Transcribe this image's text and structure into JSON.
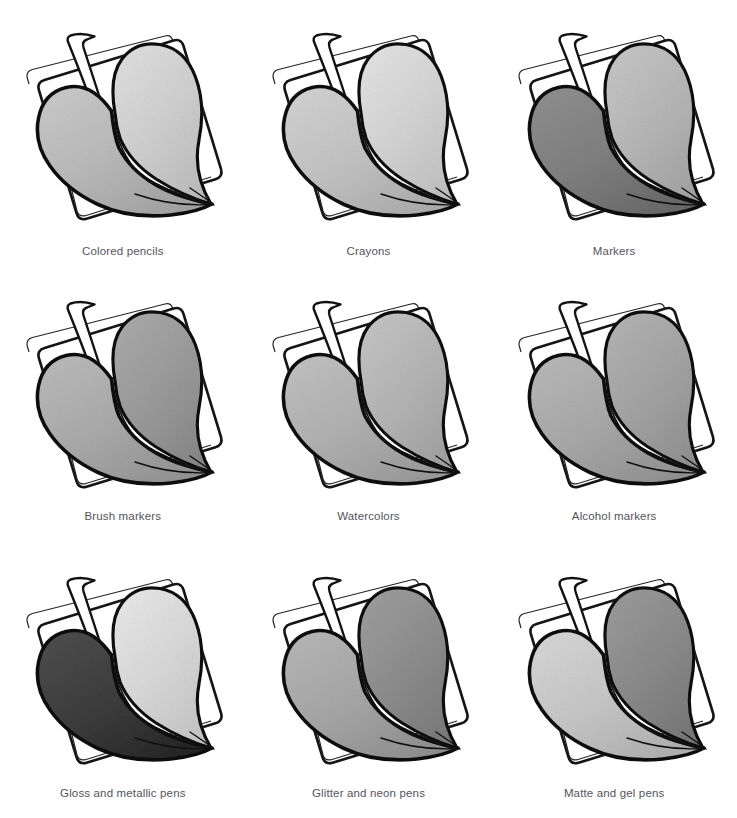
{
  "page": {
    "background_color": "#ffffff",
    "caption_color": "#55545a",
    "ink_color": "#101010",
    "columns": 3,
    "rows": 3
  },
  "cells": [
    {
      "label": "Colored pencils",
      "left_lobe_color": "#b9b9b9",
      "right_lobe_color": "#cfcfcf",
      "texture": "pencil-grain"
    },
    {
      "label": "Crayons",
      "left_lobe_color": "#c2c2c2",
      "right_lobe_color": "#d3d3d3",
      "texture": "waxy-speckle"
    },
    {
      "label": "Markers",
      "left_lobe_color": "#7f7f7f",
      "right_lobe_color": "#b6b6b6",
      "texture": "streaky"
    },
    {
      "label": "Brush markers",
      "left_lobe_color": "#aaaaaa",
      "right_lobe_color": "#9a9a9a",
      "texture": "smooth-wash"
    },
    {
      "label": "Watercolors",
      "left_lobe_color": "#b0b0b0",
      "right_lobe_color": "#b4b4b4",
      "texture": "mottled-wash"
    },
    {
      "label": "Alcohol markers",
      "left_lobe_color": "#a8a8a8",
      "right_lobe_color": "#a3a3a3",
      "texture": "even-blend"
    },
    {
      "label": "Gloss and metallic pens",
      "left_lobe_color": "#3d3d3d",
      "right_lobe_color": "#d8d8d8",
      "texture": "hatched-sparkle"
    },
    {
      "label": "Glitter and neon pens",
      "left_lobe_color": "#a6a6a6",
      "right_lobe_color": "#8d8d8d",
      "texture": "speckled"
    },
    {
      "label": "Matte and gel pens",
      "left_lobe_color": "#c6c6c6",
      "right_lobe_color": "#8a8a8a",
      "texture": "flat-matte"
    }
  ]
}
